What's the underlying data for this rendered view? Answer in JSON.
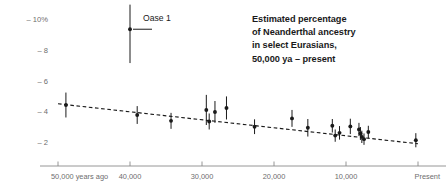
{
  "chart_data": {
    "type": "scatter",
    "title": "Estimated percentage of Neanderthal ancestry in select Eurasians, 50,000 ya – present",
    "title_lines": [
      "Estimated percentage",
      "of Neanderthal ancestry",
      "in select Eurasians,",
      "50,000 ya – present"
    ],
    "xlabel": "",
    "ylabel": "",
    "xlim": [
      50000,
      0
    ],
    "ylim": [
      0,
      11
    ],
    "grid": false,
    "legend_position": "top-center",
    "legend": [
      {
        "name": "Oase 1",
        "marker": "point-with-error-bar",
        "x": 40000,
        "y": 9.4,
        "y_low": 7.2,
        "y_high": 11.0
      }
    ],
    "xticks": [
      {
        "value": 50000,
        "label": "50,000 years ago"
      },
      {
        "value": 40000,
        "label": "40,000"
      },
      {
        "value": 30000,
        "label": "30,000"
      },
      {
        "value": 20000,
        "label": "20,000"
      },
      {
        "value": 10000,
        "label": "10,000"
      },
      {
        "value": 0,
        "label": "Present"
      }
    ],
    "yticks": [
      {
        "value": 10,
        "label": "10%"
      },
      {
        "value": 8,
        "label": "8"
      },
      {
        "value": 6,
        "label": "6"
      },
      {
        "value": 4,
        "label": "4"
      },
      {
        "value": 2,
        "label": "2"
      }
    ],
    "trendline": {
      "style": "dashed",
      "color": "#1a1a1a",
      "x_start": 50000,
      "y_start": 4.55,
      "x_end": 0,
      "y_end": 1.95
    },
    "series": [
      {
        "name": "Ancient and present-day Eurasian individuals",
        "marker_color": "#1a1a1a",
        "points": [
          {
            "x": 48900,
            "y": 4.47,
            "y_low": 3.66,
            "y_high": 5.28
          },
          {
            "x": 39000,
            "y": 3.82,
            "y_low": 3.24,
            "y_high": 4.4
          },
          {
            "x": 34300,
            "y": 3.44,
            "y_low": 2.92,
            "y_high": 3.96
          },
          {
            "x": 29400,
            "y": 4.15,
            "y_low": 3.17,
            "y_high": 5.13
          },
          {
            "x": 29000,
            "y": 3.4,
            "y_low": 2.88,
            "y_high": 3.92
          },
          {
            "x": 28200,
            "y": 4.02,
            "y_low": 3.31,
            "y_high": 4.73
          },
          {
            "x": 26600,
            "y": 4.28,
            "y_low": 3.53,
            "y_high": 5.03
          },
          {
            "x": 22700,
            "y": 3.06,
            "y_low": 2.58,
            "y_high": 3.54
          },
          {
            "x": 17500,
            "y": 3.6,
            "y_low": 3.05,
            "y_high": 4.15
          },
          {
            "x": 15300,
            "y": 2.99,
            "y_low": 2.42,
            "y_high": 3.56
          },
          {
            "x": 11900,
            "y": 3.12,
            "y_low": 2.68,
            "y_high": 3.56
          },
          {
            "x": 11500,
            "y": 2.48,
            "y_low": 2.08,
            "y_high": 2.88
          },
          {
            "x": 10900,
            "y": 2.66,
            "y_low": 2.22,
            "y_high": 3.1
          },
          {
            "x": 9400,
            "y": 3.08,
            "y_low": 2.58,
            "y_high": 3.58
          },
          {
            "x": 8200,
            "y": 2.88,
            "y_low": 2.45,
            "y_high": 3.31
          },
          {
            "x": 8000,
            "y": 2.62,
            "y_low": 2.2,
            "y_high": 3.04
          },
          {
            "x": 7800,
            "y": 2.4,
            "y_low": 2.0,
            "y_high": 2.8
          },
          {
            "x": 7500,
            "y": 2.25,
            "y_low": 1.88,
            "y_high": 2.62
          },
          {
            "x": 6900,
            "y": 2.72,
            "y_low": 2.32,
            "y_high": 3.12
          },
          {
            "x": 300,
            "y": 2.18,
            "y_low": 1.72,
            "y_high": 2.64
          }
        ]
      }
    ]
  }
}
